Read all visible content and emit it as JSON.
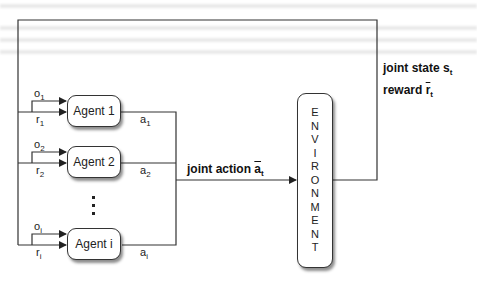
{
  "agents": [
    {
      "label": "Agent 1",
      "obs": "o",
      "obs_sub": "1",
      "rew": "r",
      "rew_sub": "1",
      "act": "a",
      "act_sub": "1"
    },
    {
      "label": "Agent 2",
      "obs": "o",
      "obs_sub": "2",
      "rew": "r",
      "rew_sub": "2",
      "act": "a",
      "act_sub": "2"
    },
    {
      "label": "Agent i",
      "obs": "o",
      "obs_sub": "i",
      "rew": "r",
      "rew_sub": "i",
      "act": "a",
      "act_sub": "i"
    }
  ],
  "environment": {
    "letters": [
      "E",
      "N",
      "V",
      "I",
      "R",
      "O",
      "N",
      "M",
      "E",
      "N",
      "T"
    ]
  },
  "joint_action": {
    "text": "joint action ",
    "symbol": "a",
    "sub": "t"
  },
  "joint_state": {
    "text": "joint state ",
    "symbol": "s",
    "sub": "t"
  },
  "reward": {
    "text": "reward ",
    "symbol": "r",
    "sub": "t"
  },
  "colors": {
    "line": "#333333",
    "box_fill": "#ffffff"
  }
}
